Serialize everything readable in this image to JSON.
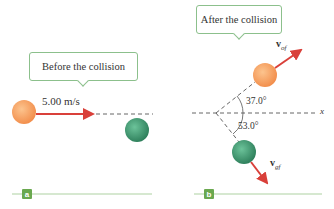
{
  "panel_a": {
    "callout": "Before the collision",
    "speed_label": "5.00 m/s",
    "tag": "a"
  },
  "panel_b": {
    "callout": "After the collision",
    "angle_top": "37.0°",
    "angle_bottom": "53.0°",
    "axis_label": "x",
    "vel_orange_symbol": "v",
    "vel_orange_sub": "of",
    "vel_green_symbol": "v",
    "vel_green_sub": "gf",
    "tag": "b"
  },
  "colors": {
    "orange_ball": "#f7a35c",
    "green_ball": "#3f9a72",
    "arrow": "#d9403a",
    "callout_border": "#8cc08c",
    "baseline": "#c8e0c0",
    "tag_fill": "#6aa84f"
  }
}
